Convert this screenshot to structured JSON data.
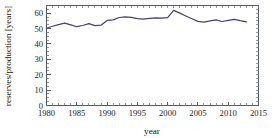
{
  "chart_data": {
    "type": "line",
    "title": "",
    "xlabel": "year",
    "ylabel": "reserves/production [years]",
    "xlim": [
      1980,
      2015
    ],
    "ylim": [
      0,
      65
    ],
    "grid": false,
    "legend": null,
    "line_color": "#4a3f78",
    "axis_color": "#555a60",
    "x_ticks": [
      1980,
      1985,
      1990,
      1995,
      2000,
      2005,
      2010,
      2015
    ],
    "x_tick_labels": [
      "1980",
      "1985",
      "1990",
      "1995",
      "2000",
      "2005",
      "2010",
      "2015"
    ],
    "x_minor_tick_step": 1,
    "y_ticks": [
      0,
      10,
      20,
      30,
      40,
      50,
      60
    ],
    "y_tick_labels": [
      "0",
      "10",
      "20",
      "30",
      "40",
      "50",
      "60"
    ],
    "y_minor_tick_step": 2.5,
    "series": [
      {
        "name": "reserves/production",
        "x": [
          1980,
          1981,
          1982,
          1983,
          1984,
          1985,
          1986,
          1987,
          1988,
          1989,
          1990,
          1991,
          1992,
          1993,
          1994,
          1995,
          1996,
          1997,
          1998,
          1999,
          2000,
          2001,
          2002,
          2003,
          2004,
          2005,
          2006,
          2007,
          2008,
          2009,
          2010,
          2011,
          2012,
          2013
        ],
        "values": [
          50.2,
          51.5,
          52.6,
          53.6,
          52.4,
          51.2,
          52.0,
          53.2,
          51.9,
          52.2,
          55.3,
          55.7,
          57.2,
          57.6,
          57.3,
          56.5,
          56.1,
          56.7,
          57.0,
          56.8,
          57.1,
          61.8,
          60.0,
          58.2,
          56.4,
          54.7,
          54.2,
          55.0,
          55.6,
          54.6,
          55.4,
          56.0,
          55.1,
          54.3
        ]
      }
    ]
  }
}
